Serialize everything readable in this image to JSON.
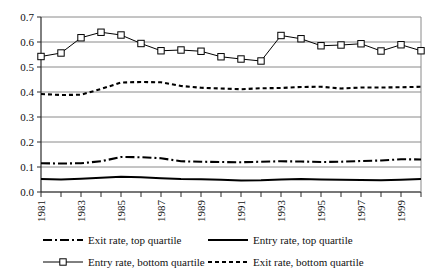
{
  "chart_data": {
    "type": "line",
    "title": "",
    "xlabel": "",
    "ylabel": "",
    "xlim": [
      1981,
      2000
    ],
    "ylim": [
      0.0,
      0.7
    ],
    "grid": true,
    "legend_position": "bottom",
    "x": [
      1981,
      1982,
      1983,
      1984,
      1985,
      1986,
      1987,
      1988,
      1989,
      1990,
      1991,
      1992,
      1993,
      1994,
      1995,
      1996,
      1997,
      1998,
      1999,
      2000
    ],
    "xticks": [
      "1981",
      "",
      "1983",
      "",
      "1985",
      "",
      "1987",
      "",
      "1989",
      "",
      "1991",
      "",
      "1993",
      "",
      "1995",
      "",
      "1997",
      "",
      "1999",
      ""
    ],
    "xtick_labels_shown": [
      "1981",
      "1983",
      "1985",
      "1987",
      "1989",
      "1991",
      "1993",
      "1995",
      "1997",
      "1999"
    ],
    "yticks": [
      "0.0",
      "0.1",
      "0.2",
      "0.3",
      "0.4",
      "0.5",
      "0.6",
      "0.7"
    ],
    "series": [
      {
        "name": "Exit rate, top quartile",
        "style": "dash-dot",
        "marker": "none",
        "color": "#000000",
        "values": [
          0.115,
          0.114,
          0.115,
          0.123,
          0.14,
          0.139,
          0.135,
          0.123,
          0.121,
          0.12,
          0.119,
          0.121,
          0.123,
          0.122,
          0.12,
          0.121,
          0.124,
          0.126,
          0.131,
          0.13
        ]
      },
      {
        "name": "Entry rate, top quartile",
        "style": "solid",
        "marker": "none",
        "color": "#000000",
        "values": [
          0.052,
          0.05,
          0.053,
          0.057,
          0.061,
          0.059,
          0.055,
          0.052,
          0.051,
          0.049,
          0.046,
          0.047,
          0.05,
          0.052,
          0.05,
          0.049,
          0.048,
          0.047,
          0.049,
          0.052
        ]
      },
      {
        "name": "Entry rate, bottom quartile",
        "style": "solid",
        "marker": "square",
        "color": "#000000",
        "values": [
          0.542,
          0.556,
          0.617,
          0.639,
          0.628,
          0.594,
          0.565,
          0.568,
          0.563,
          0.541,
          0.532,
          0.524,
          0.626,
          0.613,
          0.585,
          0.588,
          0.593,
          0.564,
          0.589,
          0.565
        ]
      },
      {
        "name": "Exit rate, bottom quartile",
        "style": "dotted",
        "marker": "none",
        "color": "#000000",
        "values": [
          0.392,
          0.388,
          0.389,
          0.412,
          0.438,
          0.44,
          0.439,
          0.424,
          0.417,
          0.414,
          0.411,
          0.415,
          0.416,
          0.42,
          0.421,
          0.414,
          0.418,
          0.418,
          0.419,
          0.421
        ]
      }
    ]
  },
  "axes": {
    "y_axis_name": "rate-axis",
    "x_axis_name": "year-axis"
  }
}
